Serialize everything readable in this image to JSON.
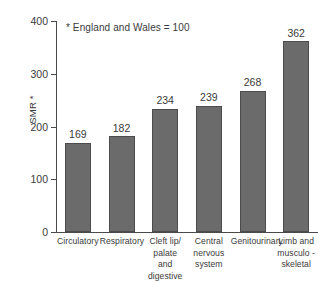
{
  "chart_data": {
    "type": "bar",
    "title": "",
    "subtitle": "",
    "xlabel": "",
    "ylabel": "SMR *",
    "annotation": "* England and Wales = 100",
    "ylim": [
      0,
      400
    ],
    "yticks": [
      0,
      100,
      200,
      300,
      400
    ],
    "ytick_labels": [
      "0",
      "100",
      "200",
      "300",
      "400"
    ],
    "grid": false,
    "legend": false,
    "bar_color": "#6b6b6b",
    "bar_border_color": "#4c4c4c",
    "axis_color": "#4a4a4a",
    "categories": [
      "Circulatory",
      "Respiratory",
      "Cleft lip/ palate and digestive",
      "Central nervous system",
      "Genitourinary",
      "Limb and musculo - skeletal"
    ],
    "category_lines": [
      [
        "Circulatory"
      ],
      [
        "Respiratory"
      ],
      [
        "Cleft lip/",
        "palate",
        "and digestive"
      ],
      [
        "Central",
        "nervous",
        "system"
      ],
      [
        "Genitourinary"
      ],
      [
        "Limb and",
        "musculo -",
        "skeletal"
      ]
    ],
    "values": [
      169,
      182,
      234,
      239,
      268,
      362
    ],
    "value_labels": [
      "169",
      "182",
      "234",
      "239",
      "268",
      "362"
    ]
  }
}
